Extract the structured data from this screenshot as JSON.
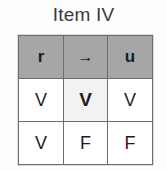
{
  "figure": {
    "title": "Item IV"
  },
  "table": {
    "columns": [
      "r",
      "→",
      "u"
    ],
    "header": [
      {
        "label": "r",
        "icon": "variable-r",
        "bold": true
      },
      {
        "label": "→",
        "icon": "right-arrow-icon",
        "bold": true
      },
      {
        "label": "u",
        "icon": "variable-u",
        "bold": true
      }
    ],
    "rows": [
      {
        "cells": [
          "V",
          "V",
          "V"
        ],
        "main_column_index": 1,
        "main_column_highlighted": true
      },
      {
        "cells": [
          "V",
          "F",
          "F"
        ],
        "main_column_index": 1,
        "main_column_highlighted": false
      }
    ]
  },
  "colors": {
    "header_background": "#a6a6a6",
    "cell_background": "#ffffff",
    "highlight_background": "#f2f2f2",
    "border": "#6d6d6d",
    "text": "#222222",
    "title_text": "#3a3a3a",
    "page_background": "#fefefe"
  }
}
